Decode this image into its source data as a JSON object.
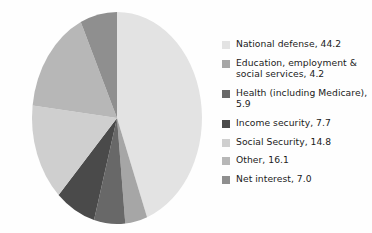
{
  "chart_data": {
    "type": "pie",
    "title": "",
    "subtitle": "",
    "xlabel": "",
    "ylabel": "",
    "legend_position": "right",
    "grid": false,
    "start_angle_deg": 90,
    "direction": "clockwise",
    "units": "percent",
    "categories": [
      "National defense",
      "Education, employment & social services",
      "Health (including Medicare)",
      "Income security",
      "Social Security",
      "Other",
      "Net interest"
    ],
    "values": [
      44.2,
      4.2,
      5.9,
      7.7,
      14.8,
      16.1,
      7.0
    ],
    "colors": [
      "#e3e3e3",
      "#a6a6a6",
      "#686868",
      "#4a4a4a",
      "#cfcfcf",
      "#b7b7b7",
      "#8f8f8f"
    ],
    "slice_labels": [
      "National defense, 44.2",
      "Education, employment &\nsocial services, 4.2",
      "Health (including Medicare),\n5.9",
      "Income security, 7.7",
      "Social Security, 14.8",
      "Other, 16.1",
      "Net interest, 7.0"
    ]
  },
  "legend": {
    "items": [
      {
        "label": "National defense, 44.2",
        "color": "#e3e3e3",
        "value": 44.2
      },
      {
        "label": "Education, employment &\nsocial services, 4.2",
        "color": "#a6a6a6",
        "value": 4.2
      },
      {
        "label": "Health (including Medicare),\n5.9",
        "color": "#686868",
        "value": 5.9
      },
      {
        "label": "Income security, 7.7",
        "color": "#4a4a4a",
        "value": 7.7
      },
      {
        "label": "Social Security, 14.8",
        "color": "#cfcfcf",
        "value": 14.8
      },
      {
        "label": "Other, 16.1",
        "color": "#b7b7b7",
        "value": 16.1
      },
      {
        "label": "Net interest, 7.0",
        "color": "#8f8f8f",
        "value": 7.0
      }
    ]
  },
  "pie_geometry": {
    "center_x": 117,
    "center_y": 118,
    "radius_x": 85,
    "radius_y": 106
  }
}
